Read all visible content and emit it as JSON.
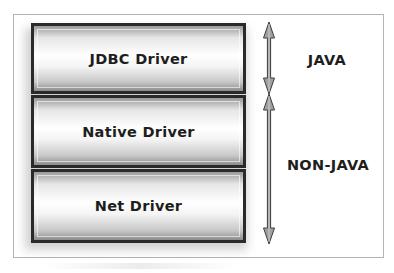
{
  "diagram": {
    "layers": [
      {
        "label": "JDBC Driver"
      },
      {
        "label": "Native Driver"
      },
      {
        "label": "Net Driver"
      }
    ],
    "groups": [
      {
        "label": "JAVA",
        "spans": [
          "JDBC Driver"
        ],
        "icon": "double-arrow-icon"
      },
      {
        "label": "NON-JAVA",
        "spans": [
          "Native Driver",
          "Net Driver"
        ],
        "icon": "double-arrow-icon"
      }
    ],
    "colors": {
      "layer_border": "#2a2a2a",
      "layer_fill_center": "#ffffff",
      "layer_fill_edge": "#8c8c8c",
      "arrow_fill": "#a0a0a0",
      "arrow_stroke": "#3c3c3c",
      "text": "#1e1e1e",
      "frame_border": "#b4b4b4"
    }
  }
}
